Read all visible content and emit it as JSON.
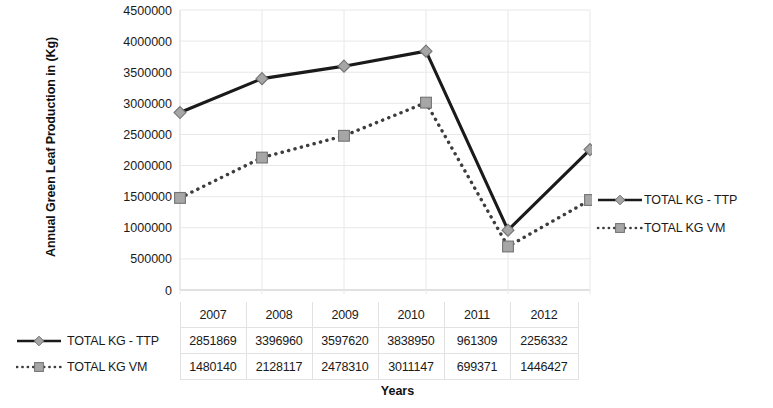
{
  "chart_data": {
    "type": "line",
    "title": "",
    "xlabel": "Years",
    "ylabel": "Annual Green Leaf Production in (Kg)",
    "categories": [
      "2007",
      "2008",
      "2009",
      "2010",
      "2011",
      "2012"
    ],
    "series": [
      {
        "name": "TOTAL KG - TTP",
        "values": [
          2851869,
          3396960,
          3597620,
          3838950,
          961309,
          2256332
        ],
        "line_style": "solid",
        "marker": "diamond",
        "color": "#1a1a1a",
        "marker_fill": "#a6a6a6"
      },
      {
        "name": "TOTAL KG VM",
        "values": [
          1480140,
          2128117,
          2478310,
          3011147,
          699371,
          1446427
        ],
        "line_style": "dotted",
        "marker": "square",
        "color": "#3d3d3d",
        "marker_fill": "#a6a6a6"
      }
    ],
    "ylim": [
      0,
      4500000
    ],
    "yticks": [
      0,
      500000,
      1000000,
      1500000,
      2000000,
      2500000,
      3000000,
      3500000,
      4000000,
      4500000
    ],
    "ytick_labels": [
      "0",
      "500000",
      "1000000",
      "1500000",
      "2000000",
      "2500000",
      "3000000",
      "3500000",
      "4000000",
      "4500000"
    ],
    "grid": true,
    "grid_color": "#e8e8e8",
    "legend_position": "right",
    "has_data_table": true
  },
  "legend": {
    "items": [
      {
        "label": "TOTAL KG - TTP"
      },
      {
        "label": "TOTAL KG VM"
      }
    ]
  },
  "data_table": {
    "header": [
      "",
      "2007",
      "2008",
      "2009",
      "2010",
      "2011",
      "2012"
    ],
    "rows": [
      {
        "label": "TOTAL KG - TTP",
        "values": [
          "2851869",
          "3396960",
          "3597620",
          "3838950",
          "961309",
          "2256332"
        ]
      },
      {
        "label": "TOTAL KG VM",
        "values": [
          "1480140",
          "2128117",
          "2478310",
          "3011147",
          "699371",
          "1446427"
        ]
      }
    ]
  }
}
